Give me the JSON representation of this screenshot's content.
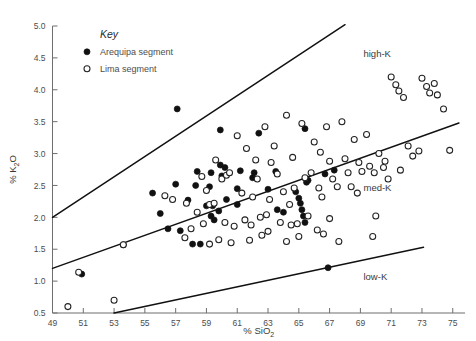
{
  "chart_data": {
    "type": "scatter",
    "title": "",
    "xlabel": "% SiO2",
    "ylabel": "% K2O",
    "xlabel_parts": {
      "pre": "% SiO",
      "sub": "2"
    },
    "ylabel_parts": {
      "pre": "% K",
      "sub": "2",
      "post": "O"
    },
    "xlim": [
      49,
      75.6
    ],
    "ylim": [
      0.5,
      5.0
    ],
    "xticks": [
      49,
      51,
      53,
      55,
      57,
      59,
      61,
      63,
      65,
      67,
      69,
      71,
      73,
      75
    ],
    "yticks": [
      0.5,
      1.0,
      1.5,
      2.0,
      2.5,
      3.0,
      3.5,
      4.0,
      4.5,
      5.0
    ],
    "xtick_labels": [
      "49",
      "51",
      "53",
      "55",
      "57",
      "59",
      "61",
      "63",
      "65",
      "67",
      "69",
      "71",
      "73",
      "75"
    ],
    "ytick_labels": [
      "0.5",
      "1.0",
      "1.5",
      "2.0",
      "2.5",
      "3.0",
      "3.5",
      "4.0",
      "4.5",
      "5.0"
    ],
    "grid": false,
    "legend_position": "top-left-inside",
    "legend": {
      "title": "Key",
      "entries": [
        {
          "label": "Arequipa segment",
          "marker": "filled-circle",
          "color": "#111111"
        },
        {
          "label": "Lima segment",
          "marker": "open-circle",
          "color": "#ffffff"
        }
      ]
    },
    "zone_labels": [
      {
        "text": "high-K",
        "x": 69.2,
        "y": 4.52
      },
      {
        "text": "med-K",
        "x": 69.2,
        "y": 2.42
      },
      {
        "text": "low-K",
        "x": 69.2,
        "y": 1.02
      }
    ],
    "boundary_lines": [
      {
        "name": "high-K / med-K boundary",
        "x1": 49.0,
        "y1": 2.0,
        "x2": 68.0,
        "y2": 5.02
      },
      {
        "name": "med-K / low-K boundary",
        "x1": 49.0,
        "y1": 1.2,
        "x2": 75.4,
        "y2": 3.48
      },
      {
        "name": "low-K lower boundary",
        "x1": 53.0,
        "y1": 0.5,
        "x2": 73.1,
        "y2": 1.53
      }
    ],
    "series": [
      {
        "name": "Arequipa segment",
        "marker": "filled-circle",
        "points": [
          [
            57.1,
            3.7
          ],
          [
            59.9,
            3.37
          ],
          [
            62.4,
            3.32
          ],
          [
            59.9,
            2.82
          ],
          [
            60.2,
            2.78
          ],
          [
            61.2,
            2.73
          ],
          [
            59.3,
            2.7
          ],
          [
            62.1,
            2.7
          ],
          [
            63.5,
            2.72
          ],
          [
            65.4,
            3.39
          ],
          [
            58.4,
            2.72
          ],
          [
            60.0,
            2.65
          ],
          [
            56.0,
            2.06
          ],
          [
            56.5,
            1.82
          ],
          [
            57.3,
            1.79
          ],
          [
            58.1,
            1.58
          ],
          [
            58.6,
            1.58
          ],
          [
            50.9,
            1.11
          ],
          [
            55.5,
            2.38
          ],
          [
            57.0,
            2.52
          ],
          [
            58.3,
            2.5
          ],
          [
            59.2,
            2.48
          ],
          [
            61.0,
            2.45
          ],
          [
            63.0,
            2.44
          ],
          [
            64.8,
            2.4
          ],
          [
            59.0,
            2.18
          ],
          [
            59.4,
            2.18
          ],
          [
            59.8,
            2.1
          ],
          [
            59.3,
            2.02
          ],
          [
            59.5,
            1.96
          ],
          [
            60.3,
            2.28
          ],
          [
            61.0,
            2.2
          ],
          [
            65.0,
            2.3
          ],
          [
            65.1,
            2.22
          ],
          [
            65.2,
            2.12
          ],
          [
            65.3,
            2.02
          ],
          [
            65.4,
            1.92
          ],
          [
            65.5,
            2.55
          ],
          [
            65.6,
            2.58
          ],
          [
            66.7,
            2.68
          ],
          [
            67.3,
            2.74
          ],
          [
            66.9,
            1.21
          ],
          [
            63.6,
            2.12
          ],
          [
            64.0,
            2.08
          ],
          [
            57.8,
            2.27
          ],
          [
            62.0,
            2.62
          ],
          [
            53.6,
            1.57
          ]
        ]
      },
      {
        "name": "Lima segment",
        "marker": "open-circle",
        "points": [
          [
            50.0,
            0.6
          ],
          [
            53.0,
            0.7
          ],
          [
            50.7,
            1.14
          ],
          [
            53.6,
            1.57
          ],
          [
            56.3,
            2.34
          ],
          [
            57.7,
            2.22
          ],
          [
            58.0,
            1.82
          ],
          [
            58.7,
            2.64
          ],
          [
            59.2,
            2.2
          ],
          [
            59.5,
            2.22
          ],
          [
            59.8,
            1.65
          ],
          [
            59.2,
            1.58
          ],
          [
            60.0,
            2.6
          ],
          [
            60.3,
            2.66
          ],
          [
            60.5,
            2.7
          ],
          [
            60.2,
            1.92
          ],
          [
            61.0,
            3.28
          ],
          [
            61.3,
            2.38
          ],
          [
            61.6,
            3.08
          ],
          [
            62.0,
            2.32
          ],
          [
            62.2,
            2.9
          ],
          [
            62.3,
            2.6
          ],
          [
            62.8,
            3.42
          ],
          [
            63.1,
            2.28
          ],
          [
            63.4,
            3.12
          ],
          [
            63.6,
            2.68
          ],
          [
            64.0,
            2.4
          ],
          [
            64.2,
            3.6
          ],
          [
            64.4,
            2.2
          ],
          [
            64.7,
            2.46
          ],
          [
            64.9,
            1.9
          ],
          [
            65.2,
            3.47
          ],
          [
            65.4,
            2.62
          ],
          [
            65.6,
            2.02
          ],
          [
            65.8,
            2.7
          ],
          [
            66.0,
            3.18
          ],
          [
            66.3,
            2.46
          ],
          [
            66.5,
            2.32
          ],
          [
            66.8,
            3.42
          ],
          [
            67.0,
            2.88
          ],
          [
            67.2,
            2.6
          ],
          [
            67.5,
            2.48
          ],
          [
            67.8,
            3.5
          ],
          [
            68.0,
            2.92
          ],
          [
            68.2,
            2.7
          ],
          [
            68.4,
            2.48
          ],
          [
            68.6,
            3.22
          ],
          [
            68.9,
            2.86
          ],
          [
            69.1,
            2.72
          ],
          [
            69.4,
            3.3
          ],
          [
            69.6,
            2.8
          ],
          [
            69.9,
            2.7
          ],
          [
            70.2,
            3.0
          ],
          [
            70.5,
            2.78
          ],
          [
            70.8,
            2.6
          ],
          [
            71.0,
            4.2
          ],
          [
            71.3,
            4.08
          ],
          [
            71.5,
            3.98
          ],
          [
            71.8,
            3.88
          ],
          [
            72.1,
            3.12
          ],
          [
            72.4,
            2.96
          ],
          [
            72.8,
            3.04
          ],
          [
            73.0,
            4.18
          ],
          [
            73.3,
            4.05
          ],
          [
            73.5,
            3.95
          ],
          [
            73.8,
            4.1
          ],
          [
            74.0,
            3.92
          ],
          [
            74.4,
            3.7
          ],
          [
            74.8,
            3.05
          ],
          [
            70.0,
            2.02
          ],
          [
            67.0,
            1.98
          ],
          [
            64.5,
            1.88
          ],
          [
            62.5,
            2.0
          ],
          [
            61.5,
            1.96
          ],
          [
            60.8,
            1.86
          ],
          [
            59.0,
            2.42
          ],
          [
            58.4,
            2.08
          ],
          [
            57.6,
            1.68
          ],
          [
            63.0,
            1.78
          ],
          [
            63.8,
            1.92
          ],
          [
            66.2,
            1.8
          ],
          [
            66.6,
            1.74
          ],
          [
            65.0,
            1.7
          ],
          [
            64.2,
            1.62
          ],
          [
            62.6,
            1.72
          ],
          [
            61.8,
            1.64
          ],
          [
            60.6,
            1.6
          ],
          [
            67.6,
            1.62
          ],
          [
            69.8,
            1.7
          ],
          [
            70.6,
            2.88
          ],
          [
            56.8,
            2.28
          ],
          [
            59.6,
            2.9
          ],
          [
            62.9,
            2.04
          ],
          [
            64.6,
            2.94
          ],
          [
            66.4,
            3.02
          ],
          [
            68.8,
            2.38
          ],
          [
            71.6,
            2.74
          ],
          [
            58.8,
            1.9
          ],
          [
            61.9,
            1.88
          ],
          [
            63.2,
            2.86
          ]
        ]
      }
    ]
  }
}
